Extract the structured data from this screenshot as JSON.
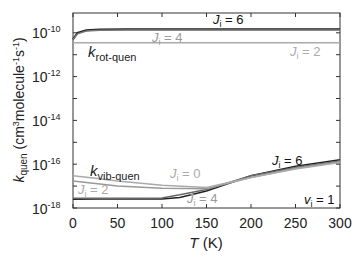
{
  "chart_data": {
    "type": "line",
    "title": "",
    "xlabel": "T (K)",
    "ylabel": "k_quen (cm^3 molecule^-1 s^-1)",
    "xlim": [
      0,
      300
    ],
    "ylim_log10": [
      -18,
      -9.1
    ],
    "yscale": "log",
    "x_ticks": [
      "0",
      "50",
      "100",
      "150",
      "200",
      "250",
      "300"
    ],
    "y_ticks": [
      "10^-10",
      "10^-12",
      "10^-14",
      "10^-16",
      "10^-18"
    ],
    "grid": false,
    "annotations": [
      {
        "text": "k_rot-quen",
        "x": 10,
        "y": "2e-12"
      },
      {
        "text": "k_vib-quen",
        "x": 10,
        "y": "4e-17"
      },
      {
        "text": "J_i = 6",
        "x": 180,
        "y": "1.5e-10"
      },
      {
        "text": "J_i = 4",
        "x": 75,
        "y": "6e-11"
      },
      {
        "text": "J_i = 2",
        "x": 270,
        "y": "1.5e-11"
      },
      {
        "text": "J_i = 6",
        "x": 260,
        "y": "2.5e-16"
      },
      {
        "text": "J_i = 0",
        "x": 110,
        "y": "2.5e-17"
      },
      {
        "text": "J_i = 2",
        "x": 15,
        "y": "4e-18"
      },
      {
        "text": "J_i = 4",
        "x": 140,
        "y": "1.5e-18"
      },
      {
        "text": "v_i = 1",
        "x": 280,
        "y": "1.3e-18"
      }
    ],
    "series": [
      {
        "name": "k_rot-quen J_i=6",
        "group": "rot",
        "color": "#222222",
        "x": [
          0,
          5,
          15,
          30,
          60,
          100,
          150,
          200,
          250,
          300
        ],
        "y": [
          5e-11,
          1e-10,
          1.3e-10,
          1.4e-10,
          1.45e-10,
          1.45e-10,
          1.45e-10,
          1.45e-10,
          1.45e-10,
          1.45e-10
        ]
      },
      {
        "name": "k_rot-quen J_i=4",
        "group": "rot",
        "color": "#777777",
        "x": [
          0,
          5,
          15,
          30,
          60,
          100,
          150,
          200,
          250,
          300
        ],
        "y": [
          5e-11,
          9e-11,
          1.2e-10,
          1.3e-10,
          1.35e-10,
          1.35e-10,
          1.35e-10,
          1.35e-10,
          1.35e-10,
          1.35e-10
        ]
      },
      {
        "name": "k_rot-quen J_i=2",
        "group": "rot",
        "color": "#aaaaaa",
        "x": [
          0,
          300
        ],
        "y": [
          3.5e-11,
          3.5e-11
        ]
      },
      {
        "name": "k_vib-quen J_i=6",
        "group": "vib",
        "color": "#222222",
        "x": [
          0,
          25,
          50,
          100,
          120,
          150,
          200,
          250,
          300
        ],
        "y": [
          2.5e-18,
          2.6e-18,
          2.6e-18,
          2.6e-18,
          3e-18,
          6e-18,
          3e-17,
          8e-17,
          1.6e-16
        ]
      },
      {
        "name": "k_vib-quen J_i=4",
        "group": "vib",
        "color": "#666666",
        "x": [
          0,
          25,
          50,
          100,
          120,
          150,
          200,
          250,
          300
        ],
        "y": [
          2.8e-18,
          2.8e-18,
          2.8e-18,
          2.9e-18,
          4e-18,
          7e-18,
          3e-17,
          7e-17,
          1.4e-16
        ]
      },
      {
        "name": "k_vib-quen J_i=2",
        "group": "vib",
        "color": "#999999",
        "x": [
          0,
          25,
          50,
          100,
          150,
          200,
          250,
          300
        ],
        "y": [
          1.7e-17,
          1.3e-17,
          1e-17,
          8e-18,
          7.5e-18,
          2.5e-17,
          6.5e-17,
          1.3e-16
        ]
      },
      {
        "name": "k_vib-quen J_i=0",
        "group": "vib",
        "color": "#aaaaaa",
        "x": [
          0,
          25,
          50,
          100,
          150,
          200,
          250,
          300
        ],
        "y": [
          3e-17,
          2.3e-17,
          1.7e-17,
          1.1e-17,
          8.5e-18,
          2.5e-17,
          6e-17,
          1.2e-16
        ]
      }
    ]
  },
  "labels": {
    "y_axis_title_main": "k",
    "y_axis_title_sub": "quen",
    "y_axis_title_units": "(cm",
    "y_axis_title_units_sup1": "3",
    "y_axis_title_units_mid": "molecule",
    "y_axis_title_units_sup2": "-1",
    "y_axis_title_units_s": "s",
    "y_axis_title_units_sup3": "-1",
    "y_axis_title_units_end": ")",
    "x_axis_title_main": "T",
    "x_axis_title_units": " (K)",
    "y_tick_base": "10",
    "y_tick_exps": [
      "-10",
      "-12",
      "-14",
      "-16",
      "-18"
    ],
    "x_ticks": [
      "0",
      "50",
      "100",
      "150",
      "200",
      "250",
      "300"
    ],
    "rot_label_main": "k",
    "rot_label_sub": "rot-quen",
    "vib_label_main": "k",
    "vib_label_sub": "vib-quen",
    "ann_rot_j6": {
      "j": "J",
      "sub": "i",
      "rest": " = 6"
    },
    "ann_rot_j4": {
      "j": "J",
      "sub": "i",
      "rest": " = 4"
    },
    "ann_rot_j2": {
      "j": "J",
      "sub": "i",
      "rest": " = 2"
    },
    "ann_vib_j6": {
      "j": "J",
      "sub": "i",
      "rest": " = 6"
    },
    "ann_vib_j0": {
      "j": "J",
      "sub": "i",
      "rest": " = 0"
    },
    "ann_vib_j2": {
      "j": "J",
      "sub": "i",
      "rest": " = 2"
    },
    "ann_vib_j4": {
      "j": "J",
      "sub": "i",
      "rest": " = 4"
    },
    "ann_vi1": {
      "j": "v",
      "sub": "i",
      "rest": " = 1"
    }
  }
}
